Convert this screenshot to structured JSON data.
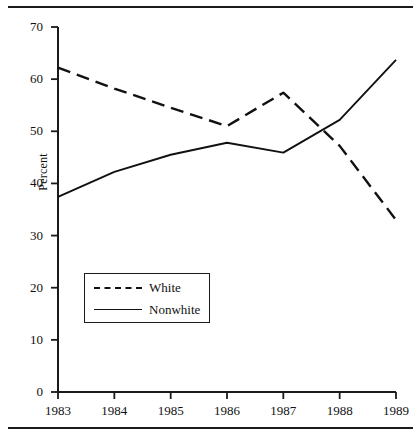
{
  "figure": {
    "name": "percent-by-race-line-chart",
    "rules": {
      "top": "horizontal-rule",
      "bottom": "horizontal-rule"
    }
  },
  "legend": {
    "entries": [
      {
        "label": "White",
        "style": "dashed"
      },
      {
        "label": "Nonwhite",
        "style": "solid"
      }
    ]
  },
  "axes": {
    "y_title": "Percent",
    "y_ticks": [
      "0",
      "10",
      "20",
      "30",
      "40",
      "50",
      "60",
      "70"
    ],
    "x_ticks": [
      "1983",
      "1984",
      "1985",
      "1986",
      "1987",
      "1988",
      "1989"
    ]
  },
  "chart_data": {
    "type": "line",
    "title": "",
    "subtitle": "",
    "xlabel": "",
    "ylabel": "Percent",
    "x": [
      1983,
      1984,
      1985,
      1986,
      1987,
      1988,
      1989
    ],
    "categories": [
      "1983",
      "1984",
      "1985",
      "1986",
      "1987",
      "1988",
      "1989"
    ],
    "series": [
      {
        "name": "White",
        "style": "dashed",
        "color": "#111111",
        "values": [
          62.2,
          58.2,
          54.5,
          51.0,
          57.4,
          47.2,
          33.0
        ]
      },
      {
        "name": "Nonwhite",
        "style": "solid",
        "color": "#111111",
        "values": [
          37.4,
          42.2,
          45.5,
          47.8,
          45.9,
          52.2,
          63.7
        ]
      }
    ],
    "xlim": [
      1983,
      1989
    ],
    "ylim": [
      0,
      70
    ],
    "ytick_values": [
      0,
      10,
      20,
      30,
      40,
      50,
      60,
      70
    ],
    "grid": false,
    "legend_position": "lower-left-inside"
  }
}
